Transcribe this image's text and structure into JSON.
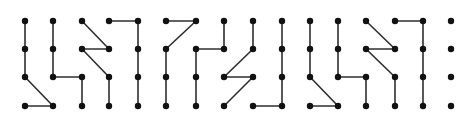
{
  "diagram": {
    "type": "dot-grid-paths",
    "width": 474,
    "height": 120,
    "colors": {
      "background": "#ffffff",
      "line": "#2e2e2e",
      "dot": "#111111"
    },
    "line_width": 1.6,
    "dot_radius": 3.2,
    "columns_x": [
      25,
      53,
      82,
      109,
      138,
      166,
      196,
      224,
      253,
      282,
      310,
      338,
      366,
      395,
      423,
      451
    ],
    "rows_y": [
      21,
      49,
      77,
      106
    ],
    "edges": [
      [
        [
          0,
          0
        ],
        [
          0,
          1
        ]
      ],
      [
        [
          0,
          1
        ],
        [
          0,
          2
        ]
      ],
      [
        [
          0,
          2
        ],
        [
          1,
          3
        ]
      ],
      [
        [
          0,
          3
        ],
        [
          1,
          3
        ]
      ],
      [
        [
          1,
          0
        ],
        [
          1,
          1
        ]
      ],
      [
        [
          1,
          1
        ],
        [
          1,
          2
        ]
      ],
      [
        [
          1,
          2
        ],
        [
          2,
          2
        ]
      ],
      [
        [
          2,
          2
        ],
        [
          2,
          3
        ]
      ],
      [
        [
          2,
          0
        ],
        [
          3,
          1
        ]
      ],
      [
        [
          3,
          1
        ],
        [
          2,
          1
        ]
      ],
      [
        [
          2,
          1
        ],
        [
          3,
          2
        ]
      ],
      [
        [
          3,
          2
        ],
        [
          3,
          3
        ]
      ],
      [
        [
          3,
          0
        ],
        [
          4,
          0
        ]
      ],
      [
        [
          4,
          0
        ],
        [
          4,
          1
        ]
      ],
      [
        [
          4,
          1
        ],
        [
          4,
          2
        ]
      ],
      [
        [
          4,
          2
        ],
        [
          4,
          3
        ]
      ],
      [
        [
          5,
          0
        ],
        [
          6,
          0
        ]
      ],
      [
        [
          6,
          0
        ],
        [
          5,
          1
        ]
      ],
      [
        [
          5,
          1
        ],
        [
          5,
          2
        ]
      ],
      [
        [
          5,
          2
        ],
        [
          5,
          3
        ]
      ],
      [
        [
          6,
          1
        ],
        [
          7,
          1
        ]
      ],
      [
        [
          7,
          0
        ],
        [
          7,
          1
        ]
      ],
      [
        [
          6,
          1
        ],
        [
          6,
          2
        ]
      ],
      [
        [
          6,
          2
        ],
        [
          6,
          3
        ]
      ],
      [
        [
          8,
          0
        ],
        [
          8,
          1
        ]
      ],
      [
        [
          8,
          1
        ],
        [
          7,
          2
        ]
      ],
      [
        [
          7,
          2
        ],
        [
          8,
          2
        ]
      ],
      [
        [
          8,
          2
        ],
        [
          7,
          3
        ]
      ],
      [
        [
          8,
          3
        ],
        [
          9,
          3
        ]
      ],
      [
        [
          9,
          0
        ],
        [
          9,
          1
        ]
      ],
      [
        [
          9,
          1
        ],
        [
          9,
          2
        ]
      ],
      [
        [
          9,
          2
        ],
        [
          9,
          3
        ]
      ],
      [
        [
          10,
          0
        ],
        [
          10,
          1
        ]
      ],
      [
        [
          10,
          1
        ],
        [
          10,
          2
        ]
      ],
      [
        [
          10,
          2
        ],
        [
          11,
          3
        ]
      ],
      [
        [
          10,
          3
        ],
        [
          11,
          3
        ]
      ],
      [
        [
          11,
          0
        ],
        [
          11,
          1
        ]
      ],
      [
        [
          11,
          1
        ],
        [
          11,
          2
        ]
      ],
      [
        [
          11,
          2
        ],
        [
          12,
          2
        ]
      ],
      [
        [
          12,
          2
        ],
        [
          12,
          3
        ]
      ],
      [
        [
          12,
          0
        ],
        [
          13,
          1
        ]
      ],
      [
        [
          13,
          1
        ],
        [
          12,
          1
        ]
      ],
      [
        [
          12,
          1
        ],
        [
          13,
          2
        ]
      ],
      [
        [
          13,
          2
        ],
        [
          13,
          3
        ]
      ],
      [
        [
          13,
          0
        ],
        [
          14,
          0
        ]
      ],
      [
        [
          14,
          0
        ],
        [
          14,
          1
        ]
      ],
      [
        [
          14,
          1
        ],
        [
          14,
          2
        ]
      ],
      [
        [
          14,
          2
        ],
        [
          14,
          3
        ]
      ]
    ],
    "groups": [
      {
        "name": "block-1",
        "columns": [
          0,
          1,
          2,
          3,
          4
        ]
      },
      {
        "name": "block-2",
        "columns": [
          5,
          6,
          7,
          8,
          9
        ]
      },
      {
        "name": "block-3",
        "columns": [
          10,
          11,
          12,
          13,
          14
        ]
      },
      {
        "name": "isolated-column",
        "columns": [
          15
        ]
      }
    ]
  }
}
